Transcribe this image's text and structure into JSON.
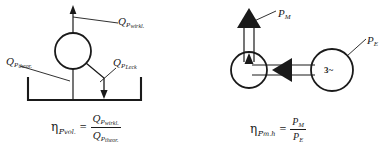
{
  "figure": {
    "background_color": "#ffffff",
    "line_color": "#1a1a1a"
  },
  "left_diagram": {
    "name": "volumetric-efficiency-diagram",
    "labels": {
      "actual_flow": {
        "base": "Q",
        "sub": "P",
        "sub2": "wirkl."
      },
      "theoretical_flow": {
        "base": "Q",
        "sub": "P",
        "sub2": "theor."
      },
      "leakage_flow": {
        "base": "Q",
        "sub": "P",
        "sub2": "Leck"
      }
    },
    "formula": {
      "symbol": "η",
      "symbol_sub": "P",
      "symbol_sub2": "vol.",
      "equals": "=",
      "numerator": {
        "base": "Q",
        "sub": "P",
        "sub2": "wirkl."
      },
      "denominator": {
        "base": "Q",
        "sub": "P",
        "sub2": "theor."
      }
    }
  },
  "right_diagram": {
    "name": "mechanical-hydraulic-efficiency-diagram",
    "motor_symbol": "3~",
    "labels": {
      "mechanical_power": {
        "base": "P",
        "sub": "M"
      },
      "electrical_power": {
        "base": "P",
        "sub": "E"
      }
    },
    "formula": {
      "symbol": "η",
      "symbol_sub": "P",
      "symbol_sub2": "m.h",
      "equals": "=",
      "numerator": {
        "base": "P",
        "sub": "M"
      },
      "denominator": {
        "base": "P",
        "sub": "E"
      }
    }
  }
}
